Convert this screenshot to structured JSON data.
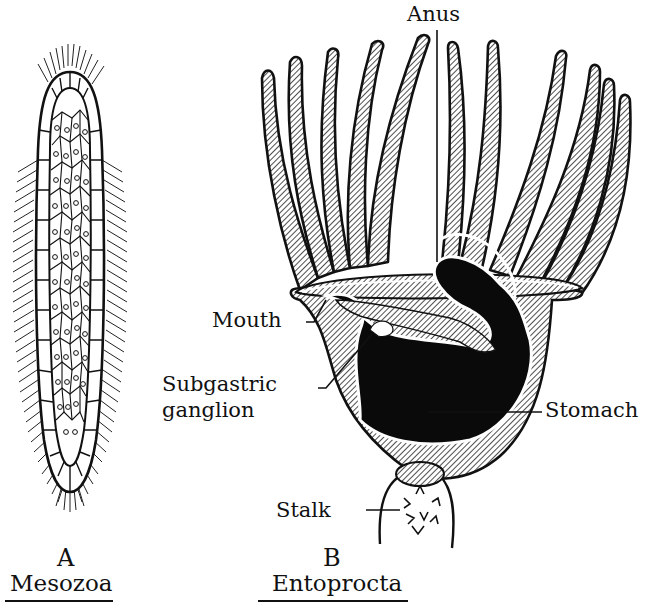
{
  "colors": {
    "ink": "#111111",
    "paper": "#ffffff",
    "hatch": "#9a9a9a"
  },
  "panels": [
    {
      "letter": "A",
      "name": "Mesozoa",
      "labels": []
    },
    {
      "letter": "B",
      "name": "Entoprocta",
      "labels": [
        {
          "id": "anus",
          "text": "Anus"
        },
        {
          "id": "mouth",
          "text": "Mouth"
        },
        {
          "id": "subgastric_line1",
          "text": "Subgastric"
        },
        {
          "id": "subgastric_line2",
          "text": "ganglion"
        },
        {
          "id": "stomach",
          "text": "Stomach"
        },
        {
          "id": "stalk",
          "text": "Stalk"
        }
      ]
    }
  ]
}
